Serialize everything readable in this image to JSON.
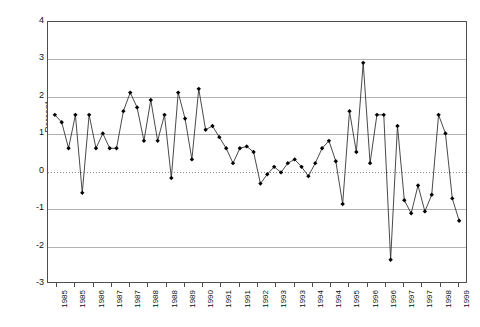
{
  "chart_data": {
    "type": "line",
    "title": "",
    "xlabel": "",
    "ylabel": "Percent",
    "ylim": [
      -3,
      4
    ],
    "yticks": [
      4,
      3,
      2,
      1,
      0,
      -1,
      -2,
      -3
    ],
    "grid": true,
    "legend": "none",
    "marker": "filled-diamond",
    "line_color": "#333333",
    "marker_color": "#000000",
    "grid_color": "#b3b3b3",
    "x_tick_labels": [
      "1985",
      "1985",
      "1986",
      "1987",
      "1987",
      "1988",
      "1988",
      "1989",
      "1990",
      "1991",
      "1991",
      "1992",
      "1993",
      "1993",
      "1994",
      "1994",
      "1995",
      "1996",
      "1996",
      "1997",
      "1997",
      "1998",
      "1999"
    ],
    "x_tick_label_rotation": -90,
    "n_points": 60,
    "series": [
      {
        "name": "Percent",
        "values": [
          1.5,
          1.3,
          0.6,
          1.5,
          -0.6,
          1.5,
          0.6,
          1.0,
          0.6,
          0.6,
          1.6,
          2.1,
          1.7,
          0.8,
          1.9,
          0.8,
          1.5,
          -0.2,
          2.1,
          1.4,
          0.3,
          2.2,
          1.1,
          1.2,
          0.9,
          0.6,
          0.2,
          0.6,
          0.65,
          0.5,
          -0.35,
          -0.1,
          0.1,
          -0.05,
          0.2,
          0.3,
          0.1,
          -0.15,
          0.2,
          0.6,
          0.8,
          0.25,
          -0.9,
          1.6,
          0.5,
          2.9,
          0.2,
          1.5,
          1.5,
          -2.4,
          1.2,
          -0.8,
          -1.15,
          -0.4,
          -1.1,
          -0.65,
          1.5,
          1.0,
          -0.75,
          -1.35
        ]
      }
    ]
  },
  "axis": {
    "y_title": "Percent"
  }
}
